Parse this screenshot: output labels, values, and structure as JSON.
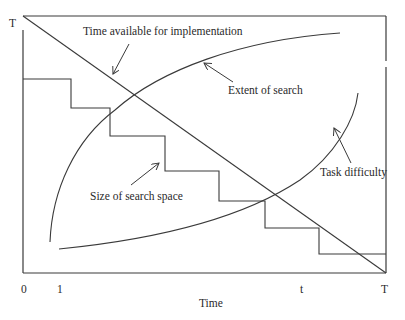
{
  "diagram": {
    "type": "conceptual-graph",
    "axes": {
      "y_axis_label": "T",
      "x_axis_label": "Time",
      "x_ticks": [
        "0",
        "1",
        "t",
        "T"
      ]
    },
    "curves": [
      {
        "id": "time-available",
        "label": "Time available for implementation",
        "shape": "straight line decreasing from T to 0"
      },
      {
        "id": "extent-of-search",
        "label": "Extent of search",
        "shape": "concave increasing curve"
      },
      {
        "id": "size-of-search-space",
        "label": "Size of search space",
        "shape": "decreasing staircase"
      },
      {
        "id": "task-difficulty",
        "label": "Task difficulty",
        "shape": "convex increasing curve"
      }
    ],
    "colors": {
      "line": "#3a3a3a",
      "background": "#ffffff"
    }
  },
  "labels": {
    "y_top": "T",
    "x_zero": "0",
    "x_one": "1",
    "x_t": "t",
    "x_T": "T",
    "x_title": "Time",
    "time_available": "Time available for implementation",
    "extent_of_search": "Extent of search",
    "size_of_search_space": "Size of search space",
    "task_difficulty": "Task difficulty"
  }
}
